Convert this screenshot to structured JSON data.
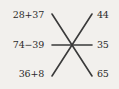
{
  "worksheet": {
    "type": "matching-exercise",
    "background_color": "#f2f0ed",
    "text_color": "#2b2b2b",
    "line_color": "#3a3a3a",
    "expressions": [
      {
        "label": "28+37",
        "name": "expression-1"
      },
      {
        "label": "74−39",
        "name": "expression-2"
      },
      {
        "label": "36+8",
        "name": "expression-3"
      }
    ],
    "answers": [
      {
        "label": "44",
        "name": "answer-1"
      },
      {
        "label": "35",
        "name": "answer-2"
      },
      {
        "label": "65",
        "name": "answer-3"
      }
    ],
    "connectors": [
      {
        "name": "connector-top-left-to-bottom-right",
        "x1": 52,
        "y1": 14,
        "x2": 92,
        "y2": 76
      },
      {
        "name": "connector-top-right-to-bottom-left",
        "x1": 92,
        "y1": 14,
        "x2": 52,
        "y2": 76
      },
      {
        "name": "connector-horizontal-middle",
        "x1": 52,
        "y1": 45,
        "x2": 92,
        "y2": 45
      }
    ],
    "crossing_point": {
      "x": 72,
      "y": 45
    }
  }
}
